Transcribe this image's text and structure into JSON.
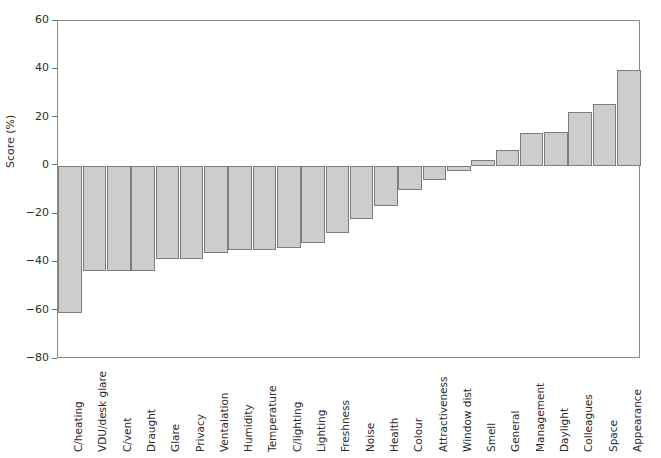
{
  "chart_data": {
    "type": "bar",
    "title": "",
    "subtitle": "",
    "xlabel": "",
    "ylabel": "Score (%)",
    "ylim": [
      -80,
      60
    ],
    "yticks": [
      60,
      40,
      20,
      0,
      -20,
      -40,
      -60,
      -80
    ],
    "ytick_labels": [
      "60",
      "40",
      "20",
      "0",
      "−20",
      "−40",
      "−60",
      "−80"
    ],
    "grid": false,
    "legend": null,
    "bar_color": "#cdcdcd",
    "bar_edge_color": "#7d7d7d",
    "axis_color": "#8a8a8a",
    "categories": [
      "C/heating",
      "VDU/desk glare",
      "C/vent",
      "Draught",
      "Glare",
      "Privacy",
      "Ventalation",
      "Humidity",
      "Temperature",
      "C/lighting",
      "Lighting",
      "Freshness",
      "Noise",
      "Health",
      "Colour",
      "Attractiveness",
      "Window dist",
      "Smell",
      "General",
      "Management",
      "Daylight",
      "Colleagues",
      "Space",
      "Appearance"
    ],
    "values": [
      -61,
      -43.5,
      -43.5,
      -43.5,
      -38.5,
      -38.5,
      -36,
      -35,
      -35,
      -34,
      -32,
      -28,
      -22,
      -16.5,
      -10,
      -6,
      -2,
      2.5,
      6.5,
      13.5,
      14,
      22.5,
      25.5,
      39.5
    ]
  }
}
